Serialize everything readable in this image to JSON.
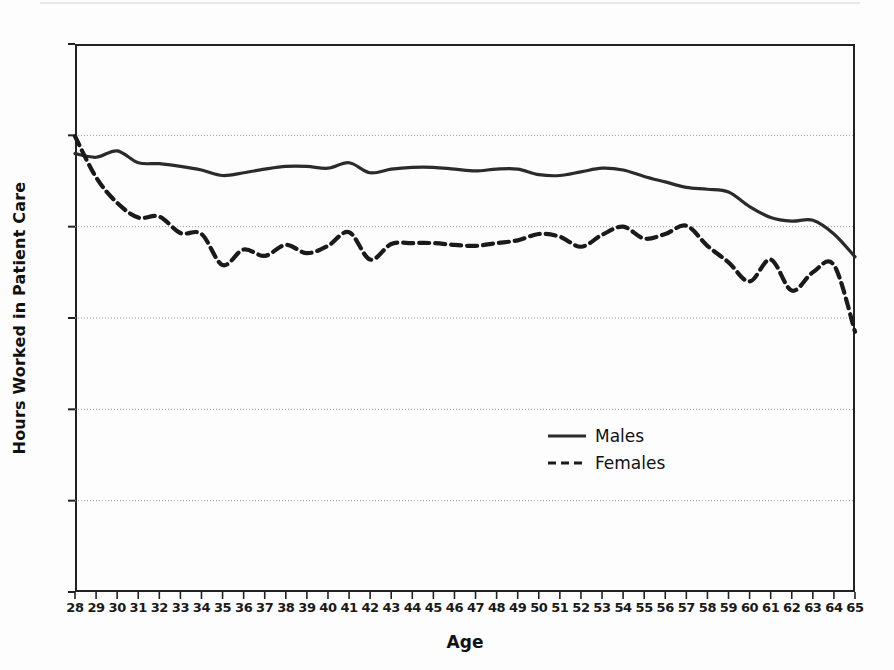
{
  "chart_data": {
    "type": "line",
    "title": "",
    "xlabel": "Age",
    "ylabel": "Hours Worked in Patient Care",
    "xlim": [
      28,
      65
    ],
    "ylim": [
      0,
      60
    ],
    "grid": true,
    "legend_position": "center-right",
    "x": [
      28,
      29,
      30,
      31,
      32,
      33,
      34,
      35,
      36,
      37,
      38,
      39,
      40,
      41,
      42,
      43,
      44,
      45,
      46,
      47,
      48,
      49,
      50,
      51,
      52,
      53,
      54,
      55,
      56,
      57,
      58,
      59,
      60,
      61,
      62,
      63,
      64,
      65
    ],
    "xticklabels": [
      "28",
      "29",
      "30",
      "31",
      "32",
      "33",
      "34",
      "35",
      "36",
      "37",
      "38",
      "39",
      "40",
      "41",
      "42",
      "43",
      "44",
      "45",
      "46",
      "47",
      "48",
      "49",
      "50",
      "51",
      "52",
      "53",
      "54",
      "55",
      "56",
      "57",
      "58",
      "59",
      "60",
      "61",
      "62",
      "63",
      "64",
      "65"
    ],
    "yticks": [
      0,
      10,
      20,
      30,
      40,
      50,
      60
    ],
    "yticklabels": [
      "0",
      "10",
      "20",
      "30",
      "40",
      "50",
      "60"
    ],
    "series": [
      {
        "name": "Males",
        "style": "solid",
        "color": "#2b2b2b",
        "values": [
          48.0,
          47.6,
          48.3,
          47.0,
          46.9,
          46.6,
          46.2,
          45.6,
          45.9,
          46.3,
          46.6,
          46.6,
          46.4,
          47.0,
          45.9,
          46.3,
          46.5,
          46.5,
          46.3,
          46.1,
          46.3,
          46.3,
          45.7,
          45.6,
          46.0,
          46.4,
          46.2,
          45.5,
          44.9,
          44.3,
          44.1,
          43.8,
          42.2,
          41.0,
          40.6,
          40.7,
          39.2,
          36.7
        ]
      },
      {
        "name": "Females",
        "style": "dashed",
        "color": "#1a1a1a",
        "values": [
          49.9,
          45.4,
          42.6,
          41.0,
          41.1,
          39.3,
          39.2,
          35.8,
          37.5,
          36.8,
          38.0,
          37.1,
          37.9,
          39.4,
          36.4,
          38.1,
          38.2,
          38.2,
          38.0,
          37.9,
          38.2,
          38.5,
          39.2,
          38.9,
          37.8,
          39.1,
          40.0,
          38.7,
          39.2,
          40.1,
          37.9,
          36.1,
          34.0,
          36.4,
          33.0,
          35.0,
          35.8,
          28.5
        ]
      }
    ]
  },
  "legend": {
    "items": [
      {
        "label": "Males",
        "style": "solid"
      },
      {
        "label": "Females",
        "style": "dashed"
      }
    ]
  }
}
